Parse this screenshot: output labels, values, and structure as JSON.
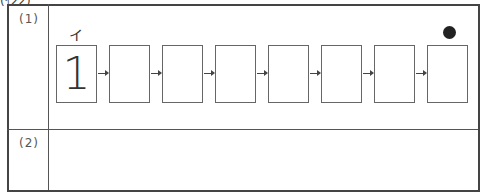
{
  "header": {
    "cut_text": "(ｲ22)"
  },
  "questions": [
    {
      "label": "(1)"
    },
    {
      "label": "(2)"
    }
  ],
  "sequence": {
    "top_label": "イ",
    "boxes": [
      {
        "value": "1"
      },
      {
        "value": ""
      },
      {
        "value": ""
      },
      {
        "value": ""
      },
      {
        "value": ""
      },
      {
        "value": ""
      },
      {
        "value": ""
      },
      {
        "value": ""
      }
    ],
    "end_marker": "filled-circle"
  }
}
